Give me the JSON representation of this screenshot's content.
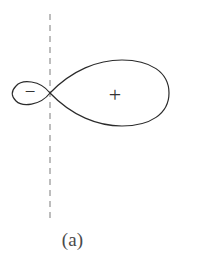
{
  "figure": {
    "caption": "(a)",
    "type": "antenna-radiation-pattern",
    "background_color": "#ffffff",
    "curve_color": "#2b2b2b",
    "curve_width": 1.2,
    "axis_line": {
      "style": "dashed",
      "color": "#9a9a9a",
      "orientation": "vertical",
      "x": 50,
      "y_start": 14,
      "y_end": 219,
      "dash_pattern": "6 5",
      "width": 1.3
    },
    "node_point": {
      "x": 50,
      "y": 93
    },
    "lobes": [
      {
        "name": "minor-lobe",
        "sign": "−",
        "sign_label_x": 30,
        "sign_label_y": 94,
        "sign_font_size": 19,
        "side": "left",
        "tip_x": 13,
        "top_y": 84,
        "bottom_y": 103,
        "path": "M 50 93 C 40 80 22 79 16 86 C 11 91 11 96 16 101 C 22 107 40 106 50 93 Z"
      },
      {
        "name": "major-lobe",
        "sign": "+",
        "sign_label_x": 115,
        "sign_label_y": 97,
        "sign_font_size": 22,
        "side": "right",
        "tip_x": 169,
        "top_y": 61,
        "bottom_y": 126,
        "path": "M 50 93 C 72 70 98 60 122 60 C 150 60 169 72 169 93 C 169 114 150 126 122 126 C 98 126 72 116 50 93 Z"
      }
    ]
  }
}
